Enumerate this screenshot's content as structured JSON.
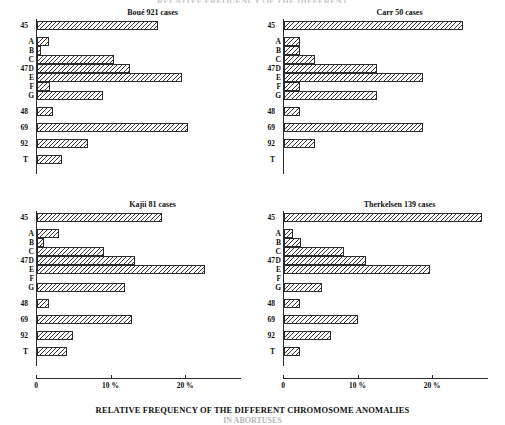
{
  "figure": {
    "top_clipped_title": "RELATIVE FREQUENCY OF THE DIFFERENT",
    "caption": "RELATIVE FREQUENCY OF THE DIFFERENT CHROMOSOME ANOMALIES",
    "caption_line2": "IN ABORTUSES",
    "axis": {
      "tick_labels": [
        "0",
        "10 %",
        "20 %"
      ],
      "tick_values": [
        0,
        10,
        20
      ],
      "max_value": 27.5
    },
    "category_labels": {
      "outer": [
        "45",
        "47",
        "48",
        "69",
        "92",
        "T"
      ],
      "inner": [
        "A",
        "B",
        "C",
        "D",
        "E",
        "F",
        "G"
      ]
    }
  },
  "chart_data": [
    {
      "type": "bar",
      "orientation": "horizontal",
      "title": "Boué    921 cases",
      "source": "Boué",
      "cases": 921,
      "xlabel": "",
      "ylabel": "",
      "xlim": [
        0,
        27.5
      ],
      "grid": false,
      "categories": [
        "45",
        "A",
        "B",
        "C",
        "D",
        "E",
        "F",
        "G",
        "48",
        "69",
        "92",
        "T"
      ],
      "values": [
        16.2,
        1.6,
        0.5,
        10.3,
        12.5,
        19.5,
        1.7,
        8.9,
        2.2,
        20.2,
        6.8,
        3.4
      ]
    },
    {
      "type": "bar",
      "orientation": "horizontal",
      "title": "Carr    50 cases",
      "source": "Carr",
      "cases": 50,
      "xlabel": "",
      "ylabel": "",
      "xlim": [
        0,
        27.5
      ],
      "grid": false,
      "categories": [
        "45",
        "A",
        "B",
        "C",
        "D",
        "E",
        "F",
        "G",
        "48",
        "69",
        "92",
        "T"
      ],
      "values": [
        24.0,
        2.1,
        2.1,
        4.2,
        12.5,
        18.7,
        2.1,
        12.5,
        2.1,
        18.7,
        4.2,
        0.0
      ]
    },
    {
      "type": "bar",
      "orientation": "horizontal",
      "title": "Kajii    81 cases",
      "source": "Kajii",
      "cases": 81,
      "xlabel": "",
      "ylabel": "",
      "xlim": [
        0,
        27.5
      ],
      "grid": false,
      "categories": [
        "45",
        "A",
        "B",
        "C",
        "D",
        "E",
        "F",
        "G",
        "48",
        "69",
        "92",
        "T"
      ],
      "values": [
        16.8,
        2.9,
        0.9,
        9.0,
        13.2,
        22.5,
        0.0,
        11.8,
        1.6,
        12.7,
        4.8,
        4.0
      ]
    },
    {
      "type": "bar",
      "orientation": "horizontal",
      "title": "Therkelsen  139 cases",
      "source": "Therkelsen",
      "cases": 139,
      "xlabel": "",
      "ylabel": "",
      "xlim": [
        0,
        27.5
      ],
      "grid": false,
      "categories": [
        "45",
        "A",
        "B",
        "C",
        "D",
        "E",
        "F",
        "G",
        "48",
        "69",
        "92",
        "T"
      ],
      "values": [
        26.5,
        1.2,
        2.3,
        8.0,
        11.0,
        19.6,
        0.0,
        5.1,
        2.2,
        9.9,
        6.3,
        2.2
      ]
    }
  ],
  "panels": [
    {
      "key": "boue",
      "chart_index": 0,
      "left": 8,
      "top": 8,
      "origin_x": 28,
      "plot_width": 205,
      "show_axis": false
    },
    {
      "key": "carr",
      "chart_index": 1,
      "left": 255,
      "top": 8,
      "origin_x": 28,
      "plot_width": 205,
      "show_axis": false
    },
    {
      "key": "kajii",
      "chart_index": 2,
      "left": 8,
      "top": 200,
      "origin_x": 28,
      "plot_width": 205,
      "show_axis": true
    },
    {
      "key": "therkelsen",
      "chart_index": 3,
      "left": 255,
      "top": 200,
      "origin_x": 28,
      "plot_width": 205,
      "show_axis": true
    }
  ]
}
